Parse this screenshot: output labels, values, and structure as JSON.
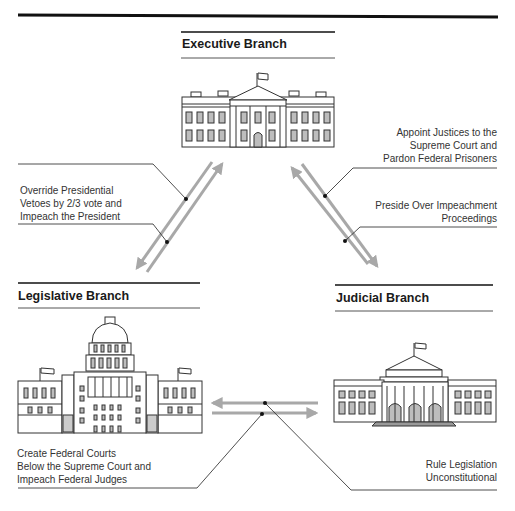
{
  "branches": {
    "executive": {
      "title": "Executive Branch"
    },
    "legislative": {
      "title": "Legislative Branch"
    },
    "judicial": {
      "title": "Judicial Branch"
    }
  },
  "checks": {
    "legislative_on_executive": [
      "Override Presidential",
      "Vetoes by 2/3 vote and",
      "Impeach the President"
    ],
    "executive_on_judicial": [
      "Appoint Justices to the",
      "Supreme Court and",
      "Pardon Federal Prisoners"
    ],
    "judicial_on_executive": [
      "Preside Over Impeachment",
      "Proceedings"
    ],
    "legislative_on_judicial": [
      "Create Federal Courts",
      "Below the Supreme Court and",
      "Impeach Federal Judges"
    ],
    "judicial_on_legislative": [
      "Rule Legislation",
      "Unconstitutional"
    ]
  },
  "colors": {
    "arrow": "#a8a8a8",
    "rule": "#111111",
    "building_fill": "#bdbdbd",
    "building_stroke": "#333333"
  }
}
